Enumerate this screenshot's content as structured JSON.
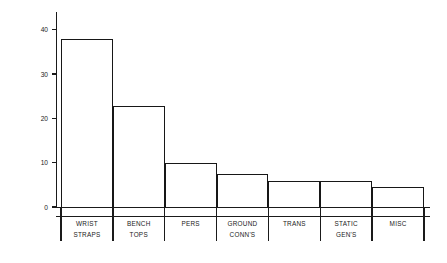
{
  "chart_data": {
    "type": "bar",
    "title": "",
    "subtitle": "",
    "xlabel": "",
    "ylabel": "% OF TOTAL DEVIATIONS",
    "categories": [
      "WRIST STRAPS",
      "BENCH TOPS",
      "PERS",
      "GROUND CONN'S",
      "TRANS",
      "STATIC GEN'S",
      "MISC"
    ],
    "category_lines": [
      [
        "WRIST",
        "STRAPS"
      ],
      [
        "BENCH",
        "TOPS"
      ],
      [
        "PERS",
        ""
      ],
      [
        "GROUND",
        "CONN'S"
      ],
      [
        "TRANS",
        ""
      ],
      [
        "STATIC",
        "GEN'S"
      ],
      [
        "MISC",
        ""
      ]
    ],
    "values": [
      38,
      22.7,
      10,
      7.4,
      5.8,
      5.8,
      4.5
    ],
    "ylim": [
      0,
      44
    ],
    "yticks": [
      0,
      10,
      20,
      30,
      40
    ],
    "ytick_labels": [
      "0",
      "10",
      "20",
      "30",
      "40"
    ],
    "grid": false,
    "legend": false,
    "legend_position": "none",
    "bar_fill": "#ffffff",
    "bar_edge_color": "#171717",
    "axis_color": "#1a1a1a",
    "background": "#ffffff"
  }
}
